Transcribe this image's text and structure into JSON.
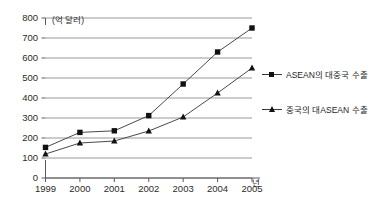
{
  "chart_data": {
    "type": "line",
    "title": "",
    "subtitle": "",
    "xlabel": "년",
    "ylabel": "(억 달러)",
    "categories": [
      "1999",
      "2000",
      "2001",
      "2002",
      "2003",
      "2004",
      "2005"
    ],
    "x": [
      1999,
      2000,
      2001,
      2002,
      2003,
      2004,
      2005
    ],
    "xlim": [
      1999,
      2005
    ],
    "ylim": [
      0,
      800
    ],
    "ytick_labels": [
      "0",
      "100",
      "200",
      "300",
      "400",
      "500",
      "600",
      "700",
      "800"
    ],
    "ytick_values": [
      0,
      100,
      200,
      300,
      400,
      500,
      600,
      700,
      800
    ],
    "grid": true,
    "legend_position": "right",
    "series": [
      {
        "name": "ASEAN의 대중국 수출",
        "marker": "square",
        "color": "#111111",
        "values": [
          153,
          228,
          236,
          312,
          470,
          630,
          750
        ]
      },
      {
        "name": "중국의 대ASEAN 수출",
        "marker": "triangle",
        "color": "#111111",
        "values": [
          120,
          175,
          185,
          235,
          305,
          425,
          550
        ]
      }
    ]
  },
  "axes": {
    "y_unit_label": "(억 달러)",
    "x_unit_label": "년"
  },
  "legend": {
    "items": [
      {
        "label": "ASEAN의 대중국 수출",
        "marker": "square"
      },
      {
        "label": "중국의 대ASEAN 수출",
        "marker": "triangle"
      }
    ]
  },
  "footer": {
    "caption": ""
  },
  "colors": {
    "ink": "#111111",
    "grid": "#8c8c8c",
    "axis": "#5a5a5a",
    "background": "#ffffff"
  }
}
